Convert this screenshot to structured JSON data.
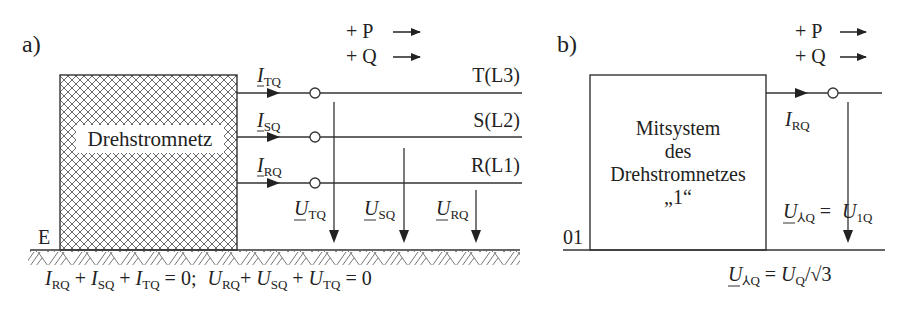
{
  "panel_a": {
    "label": "a)",
    "box_label": "Drehstromnetz",
    "earth_label": "E",
    "power_p": "+ P",
    "power_q": "+ Q",
    "currents": [
      {
        "sym": "I",
        "sub": "TQ"
      },
      {
        "sym": "I",
        "sub": "SQ"
      },
      {
        "sym": "I",
        "sub": "RQ"
      }
    ],
    "phases": [
      "T(L3)",
      "S(L2)",
      "R(L1)"
    ],
    "voltages": [
      {
        "sym": "U",
        "sub": "TQ"
      },
      {
        "sym": "U",
        "sub": "SQ"
      },
      {
        "sym": "U",
        "sub": "RQ"
      }
    ],
    "equation": {
      "i_part": [
        "I",
        "RQ",
        " + ",
        "I",
        "SQ",
        " + ",
        "I",
        "TQ",
        " = 0;"
      ],
      "u_part": [
        "U",
        "RQ",
        "+ ",
        "U",
        "SQ",
        " + ",
        "U",
        "TQ",
        " = 0"
      ]
    }
  },
  "panel_b": {
    "label": "b)",
    "power_p": "+ P",
    "power_q": "+ Q",
    "box_lines": [
      "Mitsystem",
      "des",
      "Drehstromnetzes",
      "„1“"
    ],
    "node_label": "01",
    "current": {
      "sym": "I",
      "sub": "RQ"
    },
    "voltage_eq": {
      "lhs": "U",
      "lhs_sub": "⅄Q",
      "eq": " = ",
      "rhs": "U",
      "rhs_sub": "1Q"
    },
    "bottom_eq": {
      "lhs": "U",
      "lhs_sub": "⅄Q",
      "eq": " = ",
      "rhs": "U",
      "rhs_sub": "Q",
      "tail": "/√3"
    }
  }
}
